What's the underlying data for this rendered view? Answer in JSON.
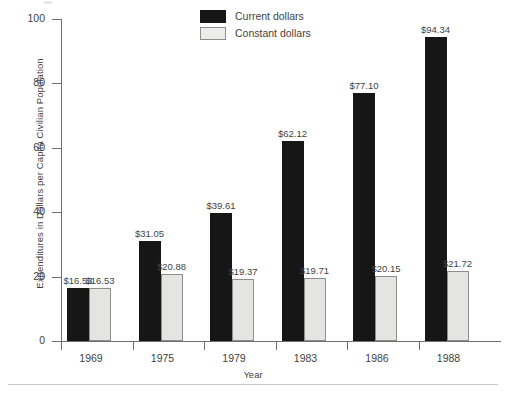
{
  "chart_data": {
    "type": "bar",
    "title": "",
    "xlabel": "Year",
    "ylabel": "Expenditures in Dollars per Capita Civilian Population",
    "categories": [
      "1969",
      "1975",
      "1979",
      "1983",
      "1986",
      "1988"
    ],
    "ylim": [
      0,
      100
    ],
    "yticks": [
      0,
      20,
      40,
      60,
      80,
      100
    ],
    "ytick_labels": [
      "0",
      "20",
      "40",
      "60",
      "80",
      "100"
    ],
    "grid": false,
    "legend_position": "top-center",
    "series": [
      {
        "name": "Current dollars",
        "color": "#161616",
        "values": [
          16.53,
          31.05,
          39.61,
          62.12,
          77.1,
          94.34
        ],
        "labels": [
          "$16.53",
          "$31.05",
          "$39.61",
          "$62.12",
          "$77.10",
          "$94.34"
        ]
      },
      {
        "name": "Constant dollars",
        "color": "#e4e4e2",
        "values": [
          16.53,
          20.88,
          19.37,
          19.71,
          20.15,
          21.72
        ],
        "labels": [
          "$16.53",
          "$20.88",
          "$19.37",
          "$19.71",
          "$20.15",
          "$21.72"
        ]
      }
    ]
  },
  "legend": {
    "items": [
      {
        "label": "Current dollars",
        "swatch": "current"
      },
      {
        "label": "Constant dollars",
        "swatch": "constant"
      }
    ]
  },
  "axes": {
    "y_title": "Expenditures in Dollars per Capita Civilian Population",
    "x_title": "Year"
  }
}
